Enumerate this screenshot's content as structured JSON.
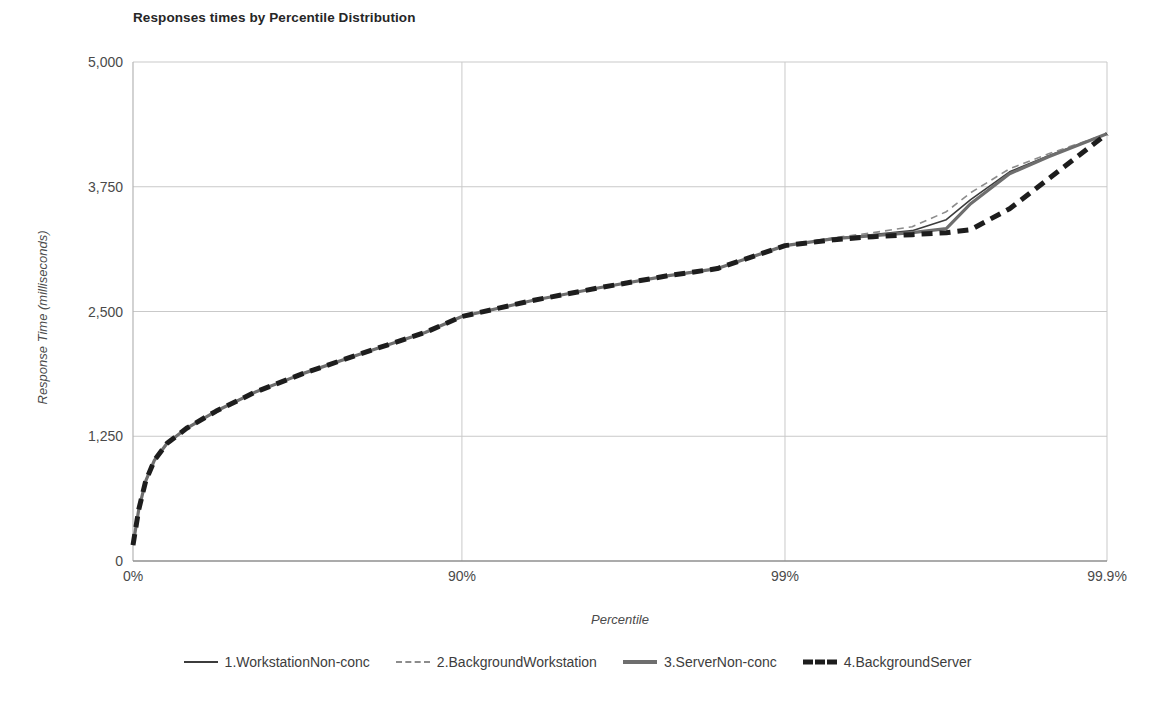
{
  "chart_data": {
    "type": "line",
    "title": "Responses times by Percentile Distribution",
    "xlabel": "Percentile",
    "ylabel": "Response Time (milliseconds)",
    "xtick_labels": [
      "0%",
      "90%",
      "99%",
      "99.9%"
    ],
    "xtick_positions": [
      0,
      0.3377,
      0.6694,
      1.0
    ],
    "ytick_labels": [
      "0",
      "1,250",
      "2,500",
      "3,750",
      "5,000"
    ],
    "ylim": [
      0,
      5000
    ],
    "grid": true,
    "legend_position": "bottom",
    "x_fraction": [
      0,
      0.006,
      0.013,
      0.022,
      0.035,
      0.055,
      0.085,
      0.125,
      0.175,
      0.235,
      0.3,
      0.3377,
      0.41,
      0.48,
      0.55,
      0.6,
      0.6694,
      0.72,
      0.76,
      0.8,
      0.835,
      0.86,
      0.9,
      0.94,
      1.0
    ],
    "series": [
      {
        "name": "1.WorkstationNon-conc",
        "style": "solid-thin",
        "color": "#3c3c3c",
        "values": [
          160,
          520,
          800,
          1010,
          1180,
          1330,
          1500,
          1690,
          1880,
          2080,
          2290,
          2450,
          2610,
          2740,
          2860,
          2930,
          3160,
          3230,
          3270,
          3310,
          3420,
          3620,
          3900,
          4060,
          4280
        ]
      },
      {
        "name": "2.BackgroundWorkstation",
        "style": "dash-thin",
        "color": "#8c8c8c",
        "values": [
          160,
          520,
          800,
          1010,
          1180,
          1330,
          1500,
          1690,
          1880,
          2080,
          2290,
          2450,
          2610,
          2740,
          2860,
          2930,
          3160,
          3240,
          3290,
          3350,
          3500,
          3690,
          3930,
          4080,
          4280
        ]
      },
      {
        "name": "3.ServerNon-conc",
        "style": "solid-thick",
        "color": "#6e6e6e",
        "values": [
          160,
          520,
          800,
          1010,
          1180,
          1330,
          1500,
          1690,
          1880,
          2080,
          2290,
          2450,
          2610,
          2740,
          2860,
          2930,
          3160,
          3230,
          3260,
          3290,
          3330,
          3580,
          3880,
          4050,
          4280
        ]
      },
      {
        "name": "4.BackgroundServer",
        "style": "dash-thick",
        "color": "#1d1d1d",
        "values": [
          160,
          520,
          800,
          1010,
          1180,
          1330,
          1500,
          1690,
          1880,
          2080,
          2290,
          2450,
          2610,
          2740,
          2860,
          2930,
          3160,
          3220,
          3250,
          3270,
          3290,
          3320,
          3530,
          3830,
          4280
        ]
      }
    ]
  },
  "legend": {
    "items": [
      {
        "label": "1.WorkstationNon-conc",
        "style": "solid-thin"
      },
      {
        "label": "2.BackgroundWorkstation",
        "style": "dash-thin"
      },
      {
        "label": "3.ServerNon-conc",
        "style": "solid-thick"
      },
      {
        "label": "4.BackgroundServer",
        "style": "dash-thick"
      }
    ]
  }
}
